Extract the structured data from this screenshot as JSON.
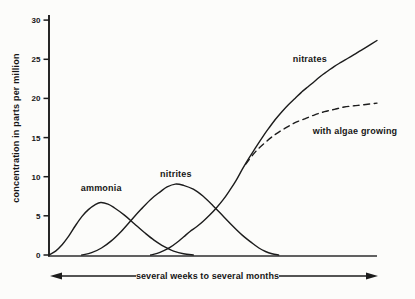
{
  "figure": {
    "background": "#fcfcfa",
    "ink": "#1c1c1c"
  },
  "chart_data": {
    "type": "line",
    "title": "",
    "ylabel": "concentration in parts per million",
    "xlabel": "several weeks to several months",
    "ylim": [
      0,
      30
    ],
    "xlim": [
      0,
      100
    ],
    "yticks": [
      0,
      5,
      10,
      15,
      20,
      25,
      30
    ],
    "xticks": [],
    "grid": false,
    "legend_position": "none",
    "series": [
      {
        "name": "ammonia",
        "dash": false,
        "points": [
          [
            0,
            0
          ],
          [
            2,
            0.5
          ],
          [
            4,
            1.3
          ],
          [
            6,
            2.4
          ],
          [
            8,
            3.7
          ],
          [
            10,
            4.9
          ],
          [
            12,
            5.8
          ],
          [
            14,
            6.4
          ],
          [
            15.8,
            6.7
          ],
          [
            18,
            6.5
          ],
          [
            20,
            6.0
          ],
          [
            23,
            5.1
          ],
          [
            26,
            4.0
          ],
          [
            29,
            2.9
          ],
          [
            32,
            1.9
          ],
          [
            35,
            1.1
          ],
          [
            38,
            0.5
          ],
          [
            41,
            0.15
          ],
          [
            44,
            0
          ]
        ]
      },
      {
        "name": "nitrites",
        "dash": false,
        "points": [
          [
            10,
            0
          ],
          [
            13,
            0.3
          ],
          [
            16,
            0.9
          ],
          [
            19,
            1.8
          ],
          [
            22,
            3.0
          ],
          [
            25,
            4.4
          ],
          [
            28,
            5.8
          ],
          [
            31,
            7.1
          ],
          [
            34,
            8.1
          ],
          [
            36,
            8.7
          ],
          [
            38.5,
            9.05
          ],
          [
            41,
            8.9
          ],
          [
            44,
            8.4
          ],
          [
            47,
            7.5
          ],
          [
            50,
            6.3
          ],
          [
            53,
            5.0
          ],
          [
            56,
            3.7
          ],
          [
            59,
            2.5
          ],
          [
            62,
            1.5
          ],
          [
            64,
            0.9
          ],
          [
            66,
            0.45
          ],
          [
            68,
            0.15
          ],
          [
            70,
            0
          ]
        ]
      },
      {
        "name": "nitrates",
        "dash": false,
        "points": [
          [
            31,
            0
          ],
          [
            33,
            0.2
          ],
          [
            35,
            0.55
          ],
          [
            37,
            1.0
          ],
          [
            39,
            1.6
          ],
          [
            41,
            2.3
          ],
          [
            43,
            3.0
          ],
          [
            45,
            3.6
          ],
          [
            47,
            4.3
          ],
          [
            49,
            5.1
          ],
          [
            51,
            6.0
          ],
          [
            53,
            7.0
          ],
          [
            55,
            8.2
          ],
          [
            57,
            9.5
          ],
          [
            59,
            11.0
          ],
          [
            61,
            12.4
          ],
          [
            63,
            13.7
          ],
          [
            65,
            15.0
          ],
          [
            67,
            16.2
          ],
          [
            69,
            17.3
          ],
          [
            71,
            18.3
          ],
          [
            73,
            19.2
          ],
          [
            75,
            20.0
          ],
          [
            77,
            20.8
          ],
          [
            79,
            21.5
          ],
          [
            81,
            22.2
          ],
          [
            83,
            22.9
          ],
          [
            85,
            23.5
          ],
          [
            87,
            24.1
          ],
          [
            89,
            24.6
          ],
          [
            91,
            25.1
          ],
          [
            93,
            25.6
          ],
          [
            95,
            26.1
          ],
          [
            97,
            26.6
          ],
          [
            100,
            27.4
          ]
        ]
      },
      {
        "name": "with algae growing",
        "dash": true,
        "points": [
          [
            60,
            11.6
          ],
          [
            63,
            13.2
          ],
          [
            66,
            14.4
          ],
          [
            69,
            15.4
          ],
          [
            72,
            16.2
          ],
          [
            75,
            16.9
          ],
          [
            78,
            17.4
          ],
          [
            81,
            17.9
          ],
          [
            84,
            18.3
          ],
          [
            87,
            18.6
          ],
          [
            90,
            18.9
          ],
          [
            93,
            19.05
          ],
          [
            96,
            19.2
          ],
          [
            100,
            19.4
          ]
        ]
      }
    ],
    "annotations": [
      {
        "text": "ammonia",
        "x": 15.9,
        "y": 8.2,
        "series": "ammonia"
      },
      {
        "text": "nitrites",
        "x": 38.7,
        "y": 10.0,
        "series": "nitrites"
      },
      {
        "text": "nitrates",
        "x": 79.5,
        "y": 24.6,
        "series": "nitrates"
      },
      {
        "text": "with algae growing",
        "x": 93.3,
        "y": 15.4,
        "series": "with algae growing"
      }
    ]
  }
}
